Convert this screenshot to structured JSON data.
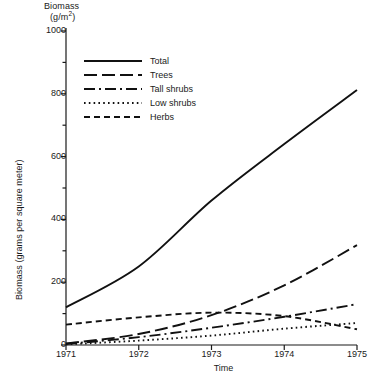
{
  "chart_data": {
    "type": "line",
    "title": "Biomass (g/m2)",
    "title_main": "Biomass",
    "title_unit": "(g/m",
    "title_unit_sup": "2",
    "title_unit_tail": ")",
    "xlabel": "Time",
    "ylabel": "Biomass (grams per square meter)",
    "x": [
      1971,
      1972,
      1973,
      1974,
      1975
    ],
    "xtick_labels": [
      "1971",
      "1972",
      "1973",
      "1974",
      "1975"
    ],
    "ytick_labels": [
      "0",
      "200",
      "400",
      "600",
      "800",
      "1000"
    ],
    "ytick_values": [
      0,
      200,
      400,
      600,
      800,
      1000
    ],
    "yminor_values": [
      100,
      300,
      500,
      700,
      900
    ],
    "xlim": [
      1971,
      1975
    ],
    "ylim": [
      0,
      1000
    ],
    "grid": false,
    "legend_position": "upper-left-inside",
    "series": [
      {
        "name": "Total",
        "style": "solid",
        "values": [
          120,
          250,
          460,
          640,
          812
        ]
      },
      {
        "name": "Trees",
        "style": "long-dash",
        "values": [
          5,
          35,
          95,
          190,
          318
        ]
      },
      {
        "name": "Tall shrubs",
        "style": "dash-dot",
        "values": [
          3,
          25,
          55,
          90,
          130
        ]
      },
      {
        "name": "Low shrubs",
        "style": "dotted",
        "values": [
          2,
          14,
          30,
          52,
          70
        ]
      },
      {
        "name": "Herbs",
        "style": "dashed",
        "values": [
          65,
          88,
          103,
          92,
          50
        ]
      }
    ]
  }
}
